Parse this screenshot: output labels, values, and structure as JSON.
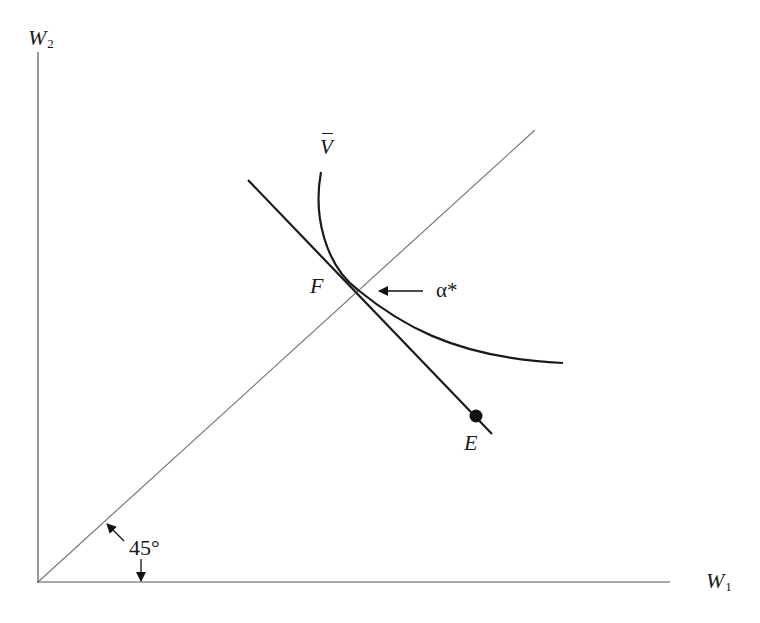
{
  "diagram": {
    "axes": {
      "y_label": {
        "base": "W",
        "sub": "2"
      },
      "x_label": {
        "base": "W",
        "sub": "1"
      }
    },
    "curve_label": "V",
    "tangent_point_label": "F",
    "endowment_label": "E",
    "slope_label": "α*",
    "angle_label": "45°",
    "colors": {
      "line": "#1a1a1a",
      "axis": "#555555",
      "certainty_line": "#777777"
    }
  }
}
